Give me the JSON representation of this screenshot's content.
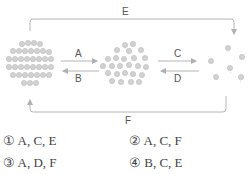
{
  "diagram": {
    "states": [
      {
        "name": "solid",
        "particle_count": 36
      },
      {
        "name": "liquid",
        "particle_count": 25
      },
      {
        "name": "gas",
        "particle_count": 6
      }
    ],
    "arrows": [
      {
        "label": "A",
        "from": "solid",
        "to": "liquid"
      },
      {
        "label": "B",
        "from": "liquid",
        "to": "solid"
      },
      {
        "label": "C",
        "from": "liquid",
        "to": "gas"
      },
      {
        "label": "D",
        "from": "gas",
        "to": "liquid"
      },
      {
        "label": "E",
        "from": "solid",
        "to": "gas"
      },
      {
        "label": "F",
        "from": "gas",
        "to": "solid"
      }
    ],
    "colors": {
      "particle": "#cfcfcf",
      "particle_edge": "#b5b5b5",
      "arrow": "#b0b0b0",
      "label": "#555555"
    }
  },
  "choices": [
    {
      "marker": "①",
      "text": "A, C, E"
    },
    {
      "marker": "②",
      "text": "A, C, F"
    },
    {
      "marker": "③",
      "text": "A, D, F"
    },
    {
      "marker": "④",
      "text": "B, C, E"
    }
  ]
}
